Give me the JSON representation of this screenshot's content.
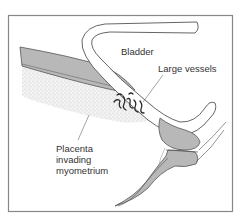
{
  "figure": {
    "labels": {
      "bladder": "Bladder",
      "large_vessels": "Large vessels",
      "placenta": [
        "Placenta",
        "invading",
        "myometrium"
      ]
    },
    "colors": {
      "frame": "#888888",
      "outline": "#555555",
      "myometrium_fill": "#b8b8b8",
      "bladder_fill": "#ffffff",
      "placenta_stipple": "#cfcfcf",
      "vessel": "#2a2a2a",
      "leader_line": "#666666"
    }
  }
}
